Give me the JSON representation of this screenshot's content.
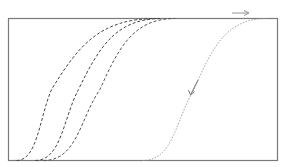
{
  "diagram": {
    "title": "",
    "frame_color": "#7a7a7a",
    "curves": [
      {
        "name": "forward-curve-1",
        "style": "dashed",
        "color": "#444444",
        "x_start": 0.03,
        "x_mid": 0.16,
        "x_end": 0.55
      },
      {
        "name": "forward-curve-2",
        "style": "dashed",
        "color": "#444444",
        "x_start": 0.1,
        "x_mid": 0.26,
        "x_end": 0.57
      },
      {
        "name": "forward-curve-3",
        "style": "dashed",
        "color": "#555555",
        "x_start": 0.13,
        "x_mid": 0.34,
        "x_end": 0.62
      },
      {
        "name": "reverse-curve",
        "style": "dotted",
        "color": "#9a9a9a",
        "x_start": 0.5,
        "x_mid": 0.69,
        "x_end": 0.96
      }
    ],
    "arrows": [
      {
        "name": "forward-arrow",
        "direction": "right",
        "color": "#888888"
      },
      {
        "name": "reverse-arrow",
        "direction": "down-left",
        "color": "#666666"
      }
    ]
  }
}
